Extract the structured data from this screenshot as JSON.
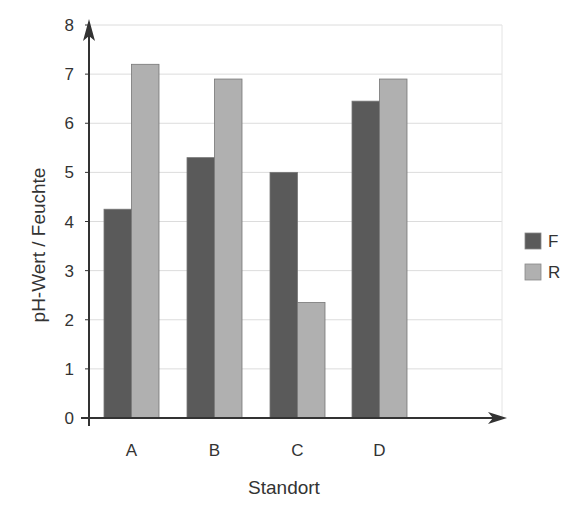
{
  "chart_data": {
    "type": "bar",
    "title": "",
    "xlabel": "Standort",
    "ylabel": "pH-Wert / Feuchte",
    "categories": [
      "A",
      "B",
      "C",
      "D"
    ],
    "series": [
      {
        "name": "F",
        "values": [
          4.25,
          5.3,
          5.0,
          6.45
        ],
        "color": "#5a5a5a"
      },
      {
        "name": "R",
        "values": [
          7.2,
          6.9,
          2.35,
          6.9
        ],
        "color": "#b0b0b0"
      }
    ],
    "ylim": [
      0,
      8
    ],
    "yticks": [
      0,
      1,
      2,
      3,
      4,
      5,
      6,
      7,
      8
    ],
    "grid": true,
    "legend_position": "right"
  }
}
